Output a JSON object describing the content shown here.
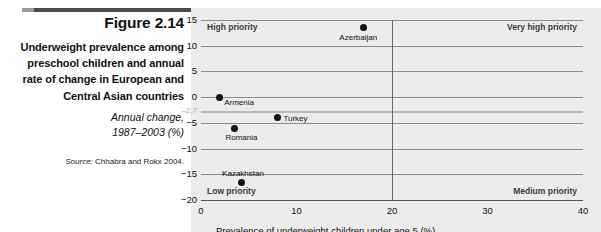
{
  "figure": {
    "number": "Figure 2.14",
    "title": "Underweight prevalence among preschool children and annual rate of change in European and Central Asian countries",
    "subtitle_line1": "Annual change,",
    "subtitle_line2": "1987–2003 (%)",
    "source_label": "Source:",
    "source_text": " Chhabra and Rokx 2004."
  },
  "chart_data": {
    "type": "scatter",
    "title": "Underweight prevalence among preschool children and annual rate of change in European and Central Asian countries",
    "xlabel": "Prevalence of underweight children under age 5 (%)",
    "ylabel": "Annual change, 1987–2003 (%)",
    "xlim": [
      0,
      40
    ],
    "ylim": [
      -20,
      15
    ],
    "xticks": [
      "0",
      "10",
      "20",
      "30",
      "40"
    ],
    "xtick_values": [
      0,
      10,
      20,
      30,
      40
    ],
    "yticks": [
      "15",
      "10",
      "5",
      "0",
      "−5",
      "−10",
      "−15",
      "−20"
    ],
    "ytick_values": [
      15,
      10,
      5,
      0,
      -5,
      -10,
      -15,
      -20
    ],
    "grid": true,
    "legend": "none",
    "reference_lines": [
      {
        "axis": "y",
        "value": -2.7,
        "label": "–2.7",
        "color": "#b9b9b9"
      },
      {
        "axis": "x",
        "value": 20,
        "label": "",
        "color": "#6b6b6b"
      }
    ],
    "quadrant_labels": [
      {
        "text": "High priority",
        "position": "top-left"
      },
      {
        "text": "Very high priority",
        "position": "top-right"
      },
      {
        "text": "Low priority",
        "position": "bottom-left"
      },
      {
        "text": "Medium priority",
        "position": "bottom-right"
      }
    ],
    "points": [
      {
        "label": "Azerbaijan",
        "x": 17.0,
        "y": 13.5
      },
      {
        "label": "Armenia",
        "x": 1.9,
        "y": 0.0
      },
      {
        "label": "Turkey",
        "x": 8.0,
        "y": -4.0
      },
      {
        "label": "Romania",
        "x": 3.5,
        "y": -6.0
      },
      {
        "label": "Kazakhstan",
        "x": 4.2,
        "y": -16.5
      }
    ]
  },
  "colors": {
    "point": "#111111",
    "plot_background": "#ececec",
    "gridline": "#8c8c8c",
    "reference_gray": "#b9b9b9",
    "rule": "#4a4a4a"
  }
}
